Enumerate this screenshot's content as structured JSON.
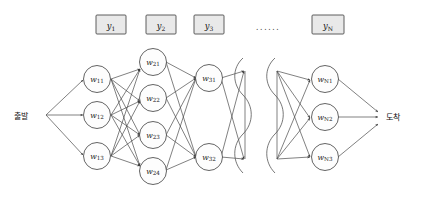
{
  "diagram": {
    "background_color": "#ffffff",
    "edge_color": "#4a4a4a",
    "node_fill": "#fdfdfd",
    "node_stroke": "#3c3c3c",
    "ybox_fill": "#e9e9e9",
    "ybox_stroke": "#4d4d4d"
  },
  "endpoints": {
    "start_label": "출발",
    "end_label": "도착"
  },
  "output_boxes": {
    "ellipsis": "......",
    "items": [
      {
        "base": "y",
        "sub": "1",
        "text": "y1"
      },
      {
        "base": "y",
        "sub": "2",
        "text": "y2"
      },
      {
        "base": "y",
        "sub": "3",
        "text": "y3"
      },
      {
        "base": "y",
        "sub": "N",
        "text": "yN"
      }
    ]
  },
  "layers": [
    {
      "name": "layer-1",
      "nodes": [
        {
          "base": "w",
          "sub": "11",
          "text": "w11"
        },
        {
          "base": "w",
          "sub": "12",
          "text": "w12"
        },
        {
          "base": "w",
          "sub": "13",
          "text": "w13"
        }
      ]
    },
    {
      "name": "layer-2",
      "nodes": [
        {
          "base": "w",
          "sub": "21",
          "text": "w21"
        },
        {
          "base": "w",
          "sub": "22",
          "text": "w22"
        },
        {
          "base": "w",
          "sub": "23",
          "text": "w23"
        },
        {
          "base": "w",
          "sub": "24",
          "text": "w24"
        }
      ]
    },
    {
      "name": "layer-3",
      "nodes": [
        {
          "base": "w",
          "sub": "31",
          "text": "w31"
        },
        {
          "base": "w",
          "sub": "32",
          "text": "w32"
        }
      ]
    },
    {
      "name": "layer-n",
      "nodes": [
        {
          "base": "w",
          "sub": "N1",
          "text": "wN1"
        },
        {
          "base": "w",
          "sub": "N2",
          "text": "wN2"
        },
        {
          "base": "w",
          "sub": "N3",
          "text": "wN3"
        }
      ]
    }
  ]
}
